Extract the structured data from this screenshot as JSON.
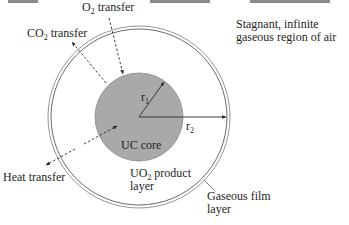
{
  "diagram": {
    "type": "shrinking-core schematic",
    "colors": {
      "core_fill": "#a9a9a9",
      "core_stroke": "#8a8a8a",
      "line": "#3a3a3a",
      "text": "#1e1e1e",
      "film_stroke": "#777777"
    },
    "labels": {
      "o2_transfer": {
        "main": "O",
        "sub": "2",
        "rest": " transfer"
      },
      "co2_transfer": {
        "main": "CO",
        "sub": "2",
        "rest": " transfer"
      },
      "stagnant_region": {
        "line1": "Stagnant, infinite",
        "line2": "gaseous region of air"
      },
      "heat_transfer": "Heat transfer",
      "uc_core": "UC core",
      "uo2_layer": {
        "main": "UO",
        "sub": "2",
        "rest": " product",
        "line2": "layer"
      },
      "gaseous_film": {
        "line1": "Gaseous film",
        "line2": "layer"
      },
      "r1": {
        "main": "r",
        "sub": "1"
      },
      "r2": {
        "main": "r",
        "sub": "2"
      }
    },
    "elements": [
      "UC core (inner gray sphere, radius r1)",
      "UO2 product layer (annulus to radius r2)",
      "Gaseous film layer (thin outer double ring)",
      "O2 transfer arrow (inward, dashed)",
      "CO2 transfer arrow (outward, dashed)",
      "Heat transfer arrow (bidirectional, dashed)"
    ]
  }
}
